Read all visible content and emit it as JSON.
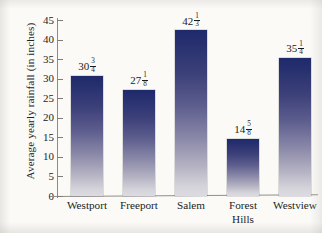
{
  "chart_data": {
    "type": "bar",
    "title": "",
    "xlabel": "",
    "ylabel": "Average yearly rainfall (in inches)",
    "ylim": [
      0,
      45
    ],
    "ytick_step": 5,
    "yticks": [
      45,
      40,
      35,
      30,
      25,
      20,
      15,
      10,
      5,
      0
    ],
    "grid": false,
    "legend": null,
    "categories": [
      "Westport",
      "Freeport",
      "Salem",
      "Forest Hills",
      "Westview"
    ],
    "values": [
      30.75,
      27.125,
      42.3333,
      14.625,
      35.25
    ],
    "value_labels": [
      "30 3/4",
      "27 1/8",
      "42 1/3",
      "14 5/8",
      "35 1/4"
    ],
    "bars": [
      {
        "category": "Westport",
        "category_line1": "Westport",
        "category_line2": "",
        "value": 30.75,
        "whole": "30",
        "numerator": "3",
        "denominator": "4"
      },
      {
        "category": "Freeport",
        "category_line1": "Freeport",
        "category_line2": "",
        "value": 27.125,
        "whole": "27",
        "numerator": "1",
        "denominator": "8"
      },
      {
        "category": "Salem",
        "category_line1": "Salem",
        "category_line2": "",
        "value": 42.3333,
        "whole": "42",
        "numerator": "1",
        "denominator": "3"
      },
      {
        "category": "Forest Hills",
        "category_line1": "Forest",
        "category_line2": "Hills",
        "value": 14.625,
        "whole": "14",
        "numerator": "5",
        "denominator": "8"
      },
      {
        "category": "Westview",
        "category_line1": "Westview",
        "category_line2": "",
        "value": 35.25,
        "whole": "35",
        "numerator": "1",
        "denominator": "4"
      }
    ],
    "colors": {
      "bar_top": "#1f2a6b",
      "bar_bottom": "#dcdbe1",
      "axis": "#8b8a86",
      "text": "#1d1b19",
      "background": "#fbfaf7"
    }
  }
}
